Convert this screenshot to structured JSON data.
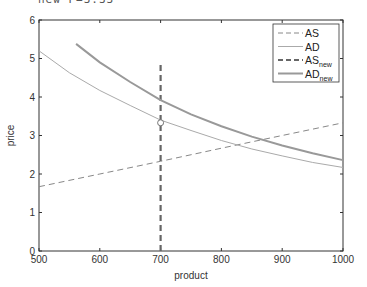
{
  "header": {
    "partial_text": "new P=3.33"
  },
  "chart_data": {
    "type": "line",
    "title": "",
    "xlabel": "product",
    "ylabel": "price",
    "xlim": [
      500,
      1000
    ],
    "ylim": [
      0,
      6
    ],
    "xticks": [
      500,
      600,
      700,
      800,
      900,
      1000
    ],
    "yticks": [
      0,
      1,
      2,
      3,
      4,
      5,
      6
    ],
    "xtick_labels": [
      "500",
      "600",
      "700",
      "800",
      "900",
      "1000"
    ],
    "ytick_labels": [
      "0",
      "1",
      "2",
      "3",
      "4",
      "5",
      "6"
    ],
    "grid": false,
    "legend_position": "upper right",
    "series": [
      {
        "name": "AS",
        "legend_main": "AS",
        "legend_sub": "",
        "style": "dashed-thin",
        "color": "#888888",
        "x": [
          500,
          600,
          700,
          800,
          900,
          1000
        ],
        "y": [
          1.67,
          2.0,
          2.33,
          2.67,
          3.0,
          3.33
        ]
      },
      {
        "name": "AD",
        "legend_main": "AD",
        "legend_sub": "",
        "style": "solid-thin",
        "color": "#aaaaaa",
        "x": [
          500,
          550,
          600,
          650,
          700,
          750,
          800,
          850,
          900,
          950,
          1000
        ],
        "y": [
          5.2,
          4.63,
          4.17,
          3.78,
          3.4,
          3.13,
          2.87,
          2.65,
          2.47,
          2.3,
          2.17
        ]
      },
      {
        "name": "AS_new",
        "legend_main": "AS",
        "legend_sub": "new",
        "style": "dashed-thick",
        "color": "#666666",
        "x": [
          700,
          700
        ],
        "y": [
          0,
          4.9
        ]
      },
      {
        "name": "AD_new",
        "legend_main": "AD",
        "legend_sub": "new",
        "style": "solid-thick",
        "color": "#999999",
        "x": [
          561,
          600,
          650,
          700,
          750,
          800,
          850,
          900,
          950,
          1000
        ],
        "y": [
          5.38,
          4.9,
          4.39,
          3.92,
          3.55,
          3.24,
          2.97,
          2.74,
          2.54,
          2.36
        ]
      }
    ],
    "annotations": [
      {
        "type": "circle-marker",
        "x": 700,
        "y": 3.33
      }
    ]
  }
}
